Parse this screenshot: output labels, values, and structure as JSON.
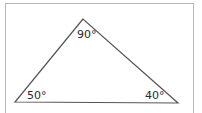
{
  "diagram": {
    "type": "triangle",
    "stroke_color": "#555555",
    "frame_color": "#b8b8b8",
    "vertices": {
      "top": {
        "x": 83,
        "y": 19
      },
      "bottom_left": {
        "x": 15,
        "y": 102
      },
      "bottom_right": {
        "x": 178,
        "y": 103
      }
    },
    "angles": {
      "top": "90°",
      "bottom_left": "50°",
      "bottom_right": "40°"
    }
  }
}
